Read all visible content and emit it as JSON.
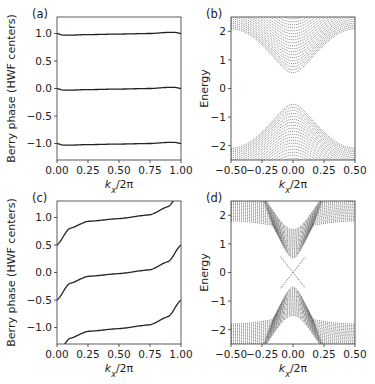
{
  "chart_data": [
    {
      "panel": "(a)",
      "type": "line",
      "xlabel": "k_x/2π",
      "ylabel": "Berry phase (HWF centers)",
      "xlim": [
        0,
        1
      ],
      "ylim": [
        -1.3,
        1.3
      ],
      "xticks": [
        "0.00",
        "0.25",
        "0.50",
        "0.75",
        "1.00"
      ],
      "yticks": [
        "-1.0",
        "-0.5",
        "0.0",
        "0.5",
        "1.0"
      ],
      "grid": false,
      "series": [
        {
          "name": "HWF center +1",
          "x": [
            0,
            0.05,
            0.1,
            0.25,
            0.5,
            0.75,
            0.9,
            0.95,
            1.0
          ],
          "y": [
            1.0,
            0.97,
            0.97,
            0.98,
            0.99,
            1.0,
            1.02,
            1.02,
            1.0
          ]
        },
        {
          "name": "HWF center 0",
          "x": [
            0,
            0.05,
            0.1,
            0.25,
            0.5,
            0.75,
            0.9,
            0.95,
            1.0
          ],
          "y": [
            0.0,
            -0.03,
            -0.03,
            -0.02,
            -0.01,
            0.0,
            0.02,
            0.02,
            0.0
          ]
        },
        {
          "name": "HWF center -1",
          "x": [
            0,
            0.05,
            0.1,
            0.25,
            0.5,
            0.75,
            0.9,
            0.95,
            1.0
          ],
          "y": [
            -1.0,
            -1.03,
            -1.03,
            -1.02,
            -1.01,
            -1.0,
            -0.98,
            -0.98,
            -1.0
          ]
        }
      ]
    },
    {
      "panel": "(b)",
      "type": "line",
      "xlabel": "k_x/2π",
      "ylabel": "Energy",
      "xlim": [
        -0.5,
        0.5
      ],
      "ylim": [
        -2.5,
        2.5
      ],
      "xticks": [
        "-0.50",
        "-0.25",
        "0.00",
        "0.25",
        "0.50"
      ],
      "yticks": [
        "-2",
        "-1",
        "0",
        "1",
        "2"
      ],
      "grid": false,
      "description": "Gapped band structure: many bulk bands, conduction band minimum ~0.5 at k=0, valence band maximum ~-0.5 at k=0",
      "gap": [
        -0.55,
        0.55
      ],
      "band_edge_at_k0": 0.55,
      "band_edge_at_zone_boundary": 2.5
    },
    {
      "panel": "(c)",
      "type": "line",
      "xlabel": "k_x/2π",
      "ylabel": "Berry phase (HWF centers)",
      "xlim": [
        0,
        1
      ],
      "ylim": [
        -1.3,
        1.3
      ],
      "xticks": [
        "0.00",
        "0.25",
        "0.50",
        "0.75",
        "1.00"
      ],
      "yticks": [
        "-1.0",
        "-0.5",
        "0.0",
        "0.5",
        "1.0"
      ],
      "grid": false,
      "series": [
        {
          "name": "winding branch 1",
          "x": [
            0,
            0.1,
            0.25,
            0.5,
            0.75,
            0.9,
            1.0
          ],
          "y": [
            0.5,
            0.8,
            0.93,
            0.98,
            1.05,
            1.2,
            1.5
          ]
        },
        {
          "name": "winding branch 2",
          "x": [
            0,
            0.1,
            0.25,
            0.5,
            0.75,
            0.9,
            1.0
          ],
          "y": [
            -0.5,
            -0.2,
            -0.07,
            -0.02,
            0.05,
            0.2,
            0.5
          ]
        },
        {
          "name": "winding branch 3",
          "x": [
            0,
            0.1,
            0.25,
            0.5,
            0.75,
            0.9,
            1.0
          ],
          "y": [
            -1.5,
            -1.2,
            -1.07,
            -1.02,
            -0.95,
            -0.8,
            -0.5
          ]
        }
      ]
    },
    {
      "panel": "(d)",
      "type": "line",
      "xlabel": "k_x/2π",
      "ylabel": "Energy",
      "xlim": [
        -0.5,
        0.5
      ],
      "ylim": [
        -2.5,
        2.5
      ],
      "xticks": [
        "-0.50",
        "-0.25",
        "0.00",
        "0.25",
        "0.50"
      ],
      "yticks": [
        "-2",
        "-1",
        "0",
        "1",
        "2"
      ],
      "grid": false,
      "description": "Ribbon band structure with bulk bands gapped (edges ~±0.5 at k=0, ~±1.5 at zone boundary) and in-gap edge states crossing at E=0, k=0",
      "edge_states": [
        {
          "x": [
            -0.1,
            0,
            0.1
          ],
          "y": [
            0.55,
            0,
            -0.55
          ]
        },
        {
          "x": [
            -0.1,
            0,
            0.1
          ],
          "y": [
            -0.55,
            0,
            0.55
          ]
        }
      ]
    }
  ],
  "panels": [
    {
      "label": "(a)",
      "ylabel": "Berry phase (HWF centers)",
      "xlabel": "k",
      "xsub": "x",
      "xsuffix": "/2π"
    },
    {
      "label": "(b)",
      "ylabel": "Energy",
      "xlabel": "k",
      "xsub": "x",
      "xsuffix": "/2π"
    },
    {
      "label": "(c)",
      "ylabel": "Berry phase (HWF centers)",
      "xlabel": "k",
      "xsub": "x",
      "xsuffix": "/2π"
    },
    {
      "label": "(d)",
      "ylabel": "Energy",
      "xlabel": "k",
      "xsub": "x",
      "xsuffix": "/2π"
    }
  ]
}
